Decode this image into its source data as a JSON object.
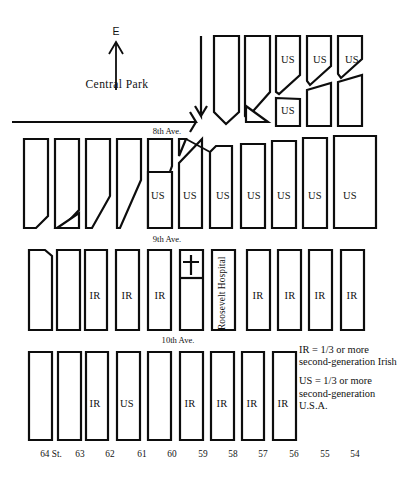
{
  "map": {
    "park_label": "Central Park",
    "direction_label": "E",
    "hospital_label": "Roosevelt Hospital",
    "avenues": [
      {
        "label": "8th Ave.",
        "x": 167,
        "y": 131
      },
      {
        "label": "9th Ave.",
        "x": 167,
        "y": 239
      },
      {
        "label": "10th Ave.",
        "x": 178,
        "y": 340
      }
    ],
    "streets": [
      {
        "label": "64 St.",
        "x": 51
      },
      {
        "label": "63",
        "x": 80
      },
      {
        "label": "62",
        "x": 110
      },
      {
        "label": "61",
        "x": 142
      },
      {
        "label": "60",
        "x": 172
      },
      {
        "label": "59",
        "x": 203
      },
      {
        "label": "58",
        "x": 233
      },
      {
        "label": "57",
        "x": 263
      },
      {
        "label": "56",
        "x": 294
      },
      {
        "label": "55",
        "x": 325
      },
      {
        "label": "54",
        "x": 355
      }
    ],
    "street_label_y": 455,
    "block_labels": [
      {
        "text": "US",
        "x": 288,
        "y": 60
      },
      {
        "text": "US",
        "x": 320,
        "y": 60
      },
      {
        "text": "US",
        "x": 352,
        "y": 60
      },
      {
        "text": "US",
        "x": 288,
        "y": 111
      },
      {
        "text": "US",
        "x": 158,
        "y": 196
      },
      {
        "text": "US",
        "x": 190,
        "y": 196
      },
      {
        "text": "US",
        "x": 223,
        "y": 196
      },
      {
        "text": "US",
        "x": 254,
        "y": 196
      },
      {
        "text": "US",
        "x": 284,
        "y": 196
      },
      {
        "text": "US",
        "x": 315,
        "y": 196
      },
      {
        "text": "US",
        "x": 350,
        "y": 196
      },
      {
        "text": "IR",
        "x": 95,
        "y": 296
      },
      {
        "text": "IR",
        "x": 127,
        "y": 296
      },
      {
        "text": "IR",
        "x": 160,
        "y": 296
      },
      {
        "text": "IR",
        "x": 258,
        "y": 296
      },
      {
        "text": "IR",
        "x": 290,
        "y": 296
      },
      {
        "text": "IR",
        "x": 320,
        "y": 296
      },
      {
        "text": "IR",
        "x": 352,
        "y": 296
      },
      {
        "text": "IR",
        "x": 95,
        "y": 404
      },
      {
        "text": "US",
        "x": 127,
        "y": 404
      },
      {
        "text": "IR",
        "x": 190,
        "y": 404
      },
      {
        "text": "IR",
        "x": 222,
        "y": 404
      },
      {
        "text": "IR",
        "x": 252,
        "y": 404
      },
      {
        "text": "IR",
        "x": 283,
        "y": 404
      }
    ]
  },
  "legend": {
    "entries": [
      {
        "text": "IR  = 1/3 or more second-generation Irish"
      },
      {
        "text": "US = 1/3 or more second-generation U.S.A."
      }
    ]
  }
}
